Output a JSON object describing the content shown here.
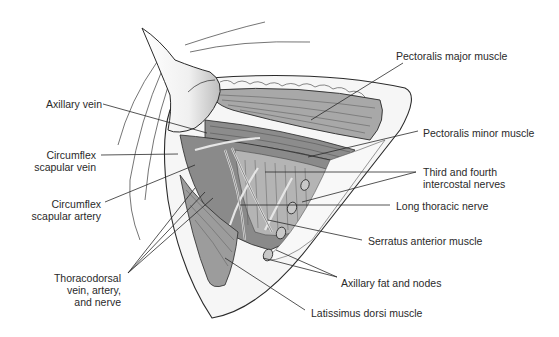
{
  "figure": {
    "colors": {
      "background": "#ffffff",
      "outline": "#2a2a2a",
      "muscle_dark": "#7a7a7a",
      "muscle_mid": "#9a9a9a",
      "muscle_light": "#b8b8b8",
      "fat": "#f4f4f4",
      "label_text": "#2a2a2a"
    }
  },
  "labels": {
    "left": [
      {
        "id": "axillary-vein",
        "lines": [
          "Axillary vein"
        ]
      },
      {
        "id": "circumflex-scapular-vein",
        "lines": [
          "Circumflex",
          "scapular vein"
        ]
      },
      {
        "id": "circumflex-scapular-artery",
        "lines": [
          "Circumflex",
          "scapular artery"
        ]
      },
      {
        "id": "thoracodorsal",
        "lines": [
          "Thoracodorsal",
          "vein, artery,",
          "and nerve"
        ]
      }
    ],
    "right": [
      {
        "id": "pectoralis-major",
        "lines": [
          "Pectoralis major muscle"
        ]
      },
      {
        "id": "pectoralis-minor",
        "lines": [
          "Pectoralis minor muscle"
        ]
      },
      {
        "id": "intercostal-nerves",
        "lines": [
          "Third and fourth",
          "intercostal nerves"
        ]
      },
      {
        "id": "long-thoracic-nerve",
        "lines": [
          "Long thoracic nerve"
        ]
      },
      {
        "id": "serratus-anterior",
        "lines": [
          "Serratus anterior muscle"
        ]
      },
      {
        "id": "axillary-fat-nodes",
        "lines": [
          "Axillary fat and nodes"
        ]
      },
      {
        "id": "latissimus-dorsi",
        "lines": [
          "Latissimus dorsi muscle"
        ]
      }
    ]
  }
}
